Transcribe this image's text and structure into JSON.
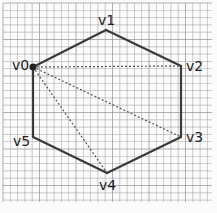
{
  "diagram": {
    "grid": {
      "x0": 3,
      "y0": 3,
      "x1": 212,
      "y1": 202,
      "spacing": 7.3,
      "color": "#8c8c8c"
    },
    "colors": {
      "edge": "#3a3a3a",
      "diagonal": "#555555",
      "vertex_dot": "#222222",
      "label": "#222222"
    },
    "vertices": [
      {
        "id": "v0",
        "label": "v0",
        "x": 33,
        "y": 67,
        "lx": 12,
        "ly": 70,
        "anchor": "start",
        "dot": true
      },
      {
        "id": "v1",
        "label": "v1",
        "x": 106,
        "y": 30,
        "lx": 98,
        "ly": 25,
        "anchor": "start",
        "dot": false
      },
      {
        "id": "v2",
        "label": "v2",
        "x": 181,
        "y": 66,
        "lx": 186,
        "ly": 71,
        "anchor": "start",
        "dot": false
      },
      {
        "id": "v3",
        "label": "v3",
        "x": 181,
        "y": 137,
        "lx": 186,
        "ly": 142,
        "anchor": "start",
        "dot": false
      },
      {
        "id": "v4",
        "label": "v4",
        "x": 107,
        "y": 173,
        "lx": 99,
        "ly": 190,
        "anchor": "start",
        "dot": false
      },
      {
        "id": "v5",
        "label": "v5",
        "x": 33,
        "y": 137,
        "lx": 13,
        "ly": 146,
        "anchor": "start",
        "dot": false
      }
    ],
    "edges": [
      [
        "v0",
        "v1"
      ],
      [
        "v1",
        "v2"
      ],
      [
        "v2",
        "v3"
      ],
      [
        "v3",
        "v4"
      ],
      [
        "v4",
        "v5"
      ],
      [
        "v5",
        "v0"
      ]
    ],
    "diagonals": [
      [
        "v0",
        "v2"
      ],
      [
        "v0",
        "v3"
      ],
      [
        "v0",
        "v4"
      ]
    ]
  }
}
